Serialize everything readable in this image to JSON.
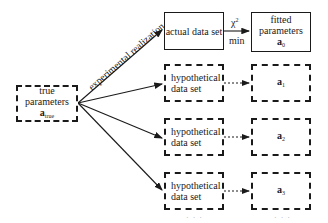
{
  "nodes": {
    "true_params": {
      "line1": "true parameters",
      "symbol": "a",
      "sub": "true"
    },
    "actual_data": {
      "label": "actual data set"
    },
    "fitted": {
      "line1": "fitted",
      "line2": "parameters",
      "symbol": "a",
      "sub": "0"
    },
    "hyp": [
      {
        "line1": "hypothetical",
        "line2": "data set",
        "symbol": "a",
        "sub": "1"
      },
      {
        "line1": "hypothetical",
        "line2": "data set",
        "symbol": "a",
        "sub": "2"
      },
      {
        "line1": "hypothetical",
        "line2": "data set",
        "symbol": "a",
        "sub": "3"
      }
    ]
  },
  "edges": {
    "realization_label": "experimental realization",
    "chi2_label": "χ",
    "chi2_sup": "2",
    "min_label": "min"
  },
  "continuation": {
    "dots_left": "· · ·",
    "dots_right": "· · ·"
  }
}
